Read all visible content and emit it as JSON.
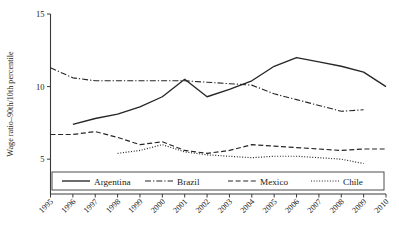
{
  "chart_data": {
    "type": "line",
    "title": "",
    "xlabel": "",
    "ylabel": "Wage ratio–90th/10th percentile",
    "x": [
      1995,
      1996,
      1997,
      1998,
      1999,
      2000,
      2001,
      2002,
      2003,
      2004,
      2005,
      2006,
      2007,
      2008,
      2009,
      2010
    ],
    "xtick_labels": [
      "1995",
      "1996",
      "1997",
      "1998",
      "1999",
      "2000",
      "2001",
      "2002",
      "2003",
      "2004",
      "2005",
      "2006",
      "2007",
      "2008",
      "2009",
      "2010"
    ],
    "ytick_labels": [
      "5",
      "10",
      "15"
    ],
    "yticks": [
      5,
      10,
      15
    ],
    "ylim": [
      2.6,
      15
    ],
    "xlim": [
      1995,
      2010
    ],
    "grid": false,
    "legend_position": "bottom-inside",
    "series": [
      {
        "name": "Argentina",
        "style": "solid",
        "x": [
          1996,
          1997,
          1998,
          1999,
          2000,
          2001,
          2002,
          2003,
          2004,
          2005,
          2006,
          2007,
          2008,
          2009,
          2010
        ],
        "values": [
          7.4,
          7.8,
          8.1,
          8.6,
          9.3,
          10.5,
          9.3,
          9.8,
          10.4,
          11.4,
          12.0,
          11.7,
          11.4,
          11.0,
          10.0
        ]
      },
      {
        "name": "Brazil",
        "style": "dashdot",
        "x": [
          1995,
          1996,
          1997,
          1998,
          1999,
          2000,
          2001,
          2002,
          2003,
          2004,
          2005,
          2006,
          2007,
          2008,
          2009
        ],
        "values": [
          11.3,
          10.6,
          10.4,
          10.4,
          10.4,
          10.4,
          10.4,
          10.3,
          10.2,
          10.1,
          9.5,
          9.1,
          8.7,
          8.3,
          8.4
        ]
      },
      {
        "name": "Mexico",
        "style": "dashed",
        "x": [
          1995,
          1996,
          1997,
          1998,
          1999,
          2000,
          2001,
          2002,
          2003,
          2004,
          2005,
          2006,
          2007,
          2008,
          2009,
          2010
        ],
        "values": [
          6.7,
          6.7,
          6.9,
          6.5,
          6.0,
          6.2,
          5.6,
          5.4,
          5.6,
          6.0,
          5.9,
          5.8,
          5.7,
          5.6,
          5.7,
          5.7
        ]
      },
      {
        "name": "Chile",
        "style": "dotted",
        "x": [
          1998,
          1999,
          2000,
          2001,
          2002,
          2003,
          2004,
          2005,
          2006,
          2007,
          2008,
          2009
        ],
        "values": [
          5.4,
          5.6,
          6.0,
          5.5,
          5.3,
          5.2,
          5.1,
          5.2,
          5.2,
          5.1,
          5.0,
          4.7
        ]
      }
    ]
  },
  "legend": {
    "items": [
      {
        "label": "Argentina",
        "style": "solid"
      },
      {
        "label": "Brazil",
        "style": "dashdot"
      },
      {
        "label": "Mexico",
        "style": "dashed"
      },
      {
        "label": "Chile",
        "style": "dotted"
      }
    ]
  },
  "colors": {
    "line": "#262626",
    "axis": "#3a3a3a",
    "background": "#ffffff"
  }
}
